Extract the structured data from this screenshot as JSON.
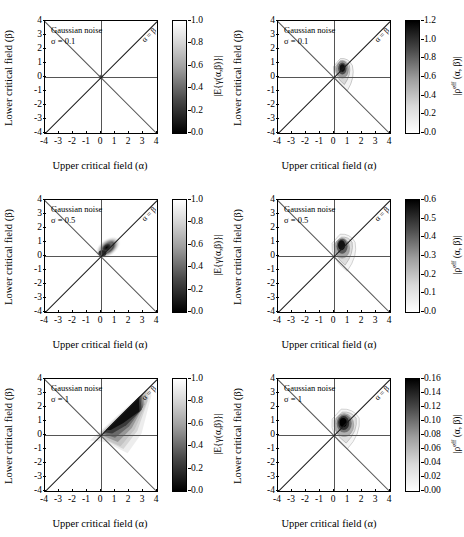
{
  "figure": {
    "axis_labels": {
      "x": "Upper critical field (α)",
      "y": "Lower critical field (β)"
    },
    "tick_labels": {
      "x": [
        "-4",
        "-3",
        "-2",
        "-1",
        "0",
        "1",
        "2",
        "3",
        "4"
      ],
      "y": [
        "4",
        "3",
        "2",
        "1",
        "0",
        "-1",
        "-2",
        "-3",
        "-4"
      ]
    },
    "diagonal_label": "α = β",
    "noise_label": "Gaussian noise"
  },
  "panels": [
    {
      "id": "panel-gamma-sigma-0p1",
      "row": 0,
      "col": 0,
      "annotation_line1": "Gaussian noise",
      "annotation_line2": "σ = 0.1",
      "colorbar_label": "|E{γ(α,β)}|",
      "colorbar_ticks": [
        "1.0",
        "0.8",
        "0.6",
        "0.4",
        "0.2",
        "0.0"
      ],
      "colorbar_direction": "white-top-black-bottom"
    },
    {
      "id": "panel-rho-sigma-0p1",
      "row": 0,
      "col": 1,
      "annotation_line1": "Gaussian noise",
      "annotation_line2": "σ = 0.1",
      "colorbar_label": "|ρeff (α, β)|",
      "colorbar_ticks": [
        "1.2",
        "1.0",
        "0.8",
        "0.6",
        "0.4",
        "0.2",
        "0.0"
      ],
      "colorbar_direction": "black-top-white-bottom"
    },
    {
      "id": "panel-gamma-sigma-0p5",
      "row": 1,
      "col": 0,
      "annotation_line1": "Gaussian noise",
      "annotation_line2": "σ = 0.5",
      "colorbar_label": "|E{γ(α,β)}|",
      "colorbar_ticks": [
        "1.0",
        "0.8",
        "0.6",
        "0.4",
        "0.2",
        "0.0"
      ],
      "colorbar_direction": "white-top-black-bottom"
    },
    {
      "id": "panel-rho-sigma-0p5",
      "row": 1,
      "col": 1,
      "annotation_line1": "Gaussian noise",
      "annotation_line2": "σ = 0.5",
      "colorbar_label": "|ρeff (α, β)|",
      "colorbar_ticks": [
        "0.6",
        "0.5",
        "0.4",
        "0.3",
        "0.2",
        "0.1",
        "0.0"
      ],
      "colorbar_direction": "black-top-white-bottom"
    },
    {
      "id": "panel-gamma-sigma-1",
      "row": 2,
      "col": 0,
      "annotation_line1": "Gaussian noise",
      "annotation_line2": "σ = 1",
      "colorbar_label": "|E{γ(α,β)}|",
      "colorbar_ticks": [
        "1.0",
        "0.8",
        "0.6",
        "0.4",
        "0.2",
        "0.0"
      ],
      "colorbar_direction": "white-top-black-bottom"
    },
    {
      "id": "panel-rho-sigma-1",
      "row": 2,
      "col": 1,
      "annotation_line1": "Gaussian noise",
      "annotation_line2": "σ = 1",
      "colorbar_label": "|ρeff (α, β)|",
      "colorbar_ticks": [
        "0.16",
        "0.14",
        "0.12",
        "0.10",
        "0.08",
        "0.06",
        "0.04",
        "0.02",
        "0.00"
      ],
      "colorbar_direction": "black-top-white-bottom"
    }
  ],
  "chart_data": {
    "type": "heatmap",
    "title": "",
    "xlabel": "Upper critical field (α)",
    "ylabel": "Lower critical field (β)",
    "xlim": [
      -4,
      4
    ],
    "ylim": [
      -4,
      4
    ],
    "xticks": [
      -4,
      -3,
      -2,
      -1,
      0,
      1,
      2,
      3,
      4
    ],
    "yticks": [
      -4,
      -3,
      -2,
      -1,
      0,
      1,
      2,
      3,
      4
    ],
    "grid": false,
    "legend_position": "right-colorbar",
    "annotations": [
      "α = β diagonal line",
      "anti-diagonal reference line",
      "Gaussian noise"
    ],
    "subplots": [
      {
        "name": "|E{γ(α,β)}| at σ = 0.1",
        "quantity": "|E{gamma(alpha,beta)}|",
        "sigma": 0.1,
        "cmap": "gray",
        "vmin": 0.0,
        "vmax": 1.0,
        "colorbar_ticks": [
          0.0,
          0.2,
          0.4,
          0.6,
          0.8,
          1.0
        ],
        "peak_location": [
          0.0,
          0.0
        ],
        "peak_value": 0.0,
        "description": "Near-delta dark concentration at the origin; background uniformly white (value 1)."
      },
      {
        "name": "|ρeff (α, β)| at σ = 0.1",
        "quantity": "|rho_eff(alpha,beta)|",
        "sigma": 0.1,
        "cmap": "gray_r",
        "vmin": 0.0,
        "vmax": 1.3,
        "colorbar_ticks": [
          0.0,
          0.2,
          0.4,
          0.6,
          0.8,
          1.0,
          1.2
        ],
        "peak_location": [
          0.6,
          -0.6
        ],
        "peak_value": 1.3,
        "description": "Compact teardrop contour lobe just below-right of origin, tapering toward (1.6,-2)."
      },
      {
        "name": "|E{γ(α,β)}| at σ = 0.5",
        "quantity": "|E{gamma(alpha,beta)}|",
        "sigma": 0.5,
        "cmap": "gray",
        "vmin": 0.0,
        "vmax": 1.0,
        "colorbar_ticks": [
          0.0,
          0.2,
          0.4,
          0.6,
          0.8,
          1.0
        ],
        "peak_location": [
          0.4,
          -0.6
        ],
        "peak_value": 0.0,
        "description": "Dark smudge elongated along the diagonal below origin, extending to about α=1.5, β=-1.3."
      },
      {
        "name": "|ρeff (α, β)| at σ = 0.5",
        "quantity": "|rho_eff(alpha,beta)|",
        "sigma": 0.5,
        "cmap": "gray_r",
        "vmin": 0.0,
        "vmax": 0.6,
        "colorbar_ticks": [
          0.0,
          0.1,
          0.2,
          0.3,
          0.4,
          0.5,
          0.6
        ],
        "peak_location": [
          0.6,
          -0.7
        ],
        "peak_value": 0.6,
        "description": "Teardrop lobe with nested contours centred near (0.6,-0.7), tail toward (1.8,-2.2)."
      },
      {
        "name": "|E{γ(α,β)}| at σ = 1",
        "quantity": "|E{gamma(alpha,beta)}|",
        "sigma": 1.0,
        "cmap": "gray",
        "vmin": 0.0,
        "vmax": 1.0,
        "colorbar_ticks": [
          0.0,
          0.2,
          0.4,
          0.6,
          0.8,
          1.0
        ],
        "peak_location": [
          1.8,
          -1.8
        ],
        "peak_value": 0.0,
        "description": "Broad dark wedge filling the region below the α=β diagonal, widest near α=2..3, reaching β=-3."
      },
      {
        "name": "|ρeff (α, β)| at σ = 1",
        "quantity": "|rho_eff(alpha,beta)|",
        "sigma": 1.0,
        "cmap": "gray_r",
        "vmin": 0.0,
        "vmax": 0.17,
        "colorbar_ticks": [
          0.0,
          0.02,
          0.04,
          0.06,
          0.08,
          0.1,
          0.12,
          0.14,
          0.16
        ],
        "peak_location": [
          0.8,
          -0.8
        ],
        "peak_value": 0.17,
        "description": "Larger rounded lobe centred near (0.8,-0.8) with outer contour extending to (1.8,-2.3)."
      }
    ]
  }
}
